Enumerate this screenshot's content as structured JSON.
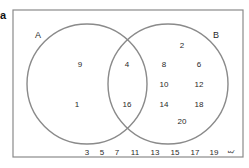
{
  "panel_label": "a",
  "universal_symbol": "ξ",
  "sets": {
    "A": {
      "label": "A"
    },
    "B": {
      "label": "B"
    }
  },
  "regions": {
    "A_only": [
      "9",
      "1"
    ],
    "A_and_B": [
      "4",
      "16"
    ],
    "B_only": [
      "2",
      "8",
      "6",
      "10",
      "12",
      "14",
      "18",
      "20"
    ],
    "outside": [
      "3",
      "5",
      "7",
      "11",
      "13",
      "15",
      "17",
      "19"
    ]
  },
  "colors": {
    "circle_stroke": "#8a8a8a",
    "frame_stroke": "#8a8a8a",
    "text": "#2a2a2a"
  }
}
